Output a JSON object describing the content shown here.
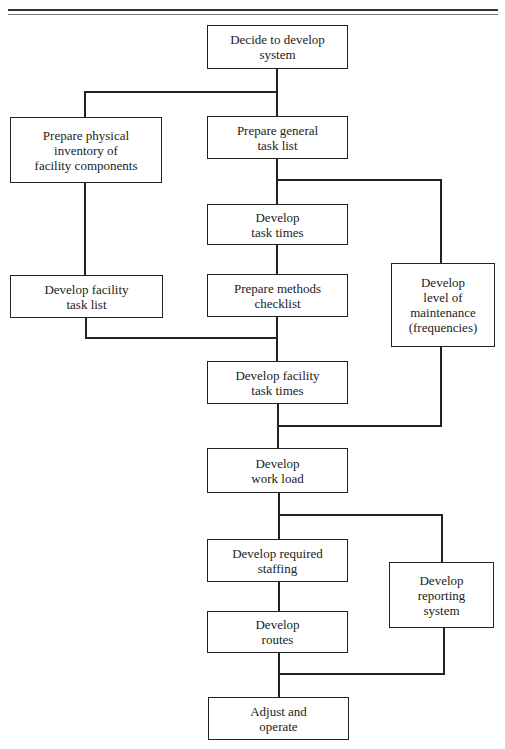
{
  "diagram": {
    "type": "flowchart",
    "nodes": [
      {
        "id": "decide",
        "label": "Decide to develop\nsystem"
      },
      {
        "id": "inventory",
        "label": "Prepare physical\ninventory of\nfacility components"
      },
      {
        "id": "general_tasks",
        "label": "Prepare general\ntask list"
      },
      {
        "id": "task_times",
        "label": "Develop\ntask times"
      },
      {
        "id": "facility_task_list",
        "label": "Develop facility\ntask list"
      },
      {
        "id": "methods_checklist",
        "label": "Prepare methods\nchecklist"
      },
      {
        "id": "maintenance_level",
        "label": "Develop\nlevel of\nmaintenance\n(frequencies)"
      },
      {
        "id": "facility_task_times",
        "label": "Develop facility\ntask times"
      },
      {
        "id": "work_load",
        "label": "Develop\nwork load"
      },
      {
        "id": "required_staffing",
        "label": "Develop required\nstaffing"
      },
      {
        "id": "reporting_system",
        "label": "Develop\nreporting\nsystem"
      },
      {
        "id": "routes",
        "label": "Develop\nroutes"
      },
      {
        "id": "adjust_operate",
        "label": "Adjust and\noperate"
      }
    ],
    "edges": [
      [
        "decide",
        "inventory"
      ],
      [
        "decide",
        "general_tasks"
      ],
      [
        "general_tasks",
        "task_times"
      ],
      [
        "general_tasks",
        "maintenance_level"
      ],
      [
        "task_times",
        "methods_checklist"
      ],
      [
        "inventory",
        "facility_task_list"
      ],
      [
        "facility_task_list",
        "facility_task_times"
      ],
      [
        "methods_checklist",
        "facility_task_times"
      ],
      [
        "facility_task_times",
        "work_load"
      ],
      [
        "maintenance_level",
        "work_load"
      ],
      [
        "work_load",
        "required_staffing"
      ],
      [
        "work_load",
        "reporting_system"
      ],
      [
        "required_staffing",
        "routes"
      ],
      [
        "routes",
        "adjust_operate"
      ],
      [
        "reporting_system",
        "adjust_operate"
      ]
    ]
  }
}
